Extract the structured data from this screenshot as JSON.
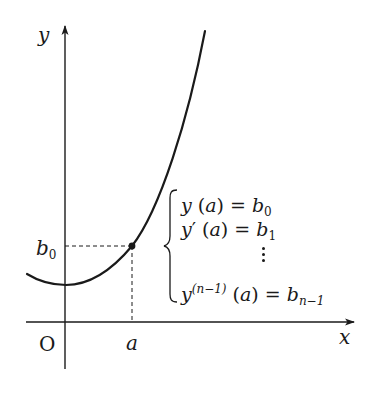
{
  "diagram": {
    "axes": {
      "x_label": "x",
      "y_label": "y",
      "origin_label": "O"
    },
    "curve": {
      "description": "convex curve passing through initial point (a, b0)"
    },
    "point": {
      "x_label": "a",
      "y_label_base": "b",
      "y_label_sub": "0"
    },
    "conditions": [
      {
        "lhs_func": "y",
        "lhs_mark": "",
        "lhs_arg": "(a)",
        "rhs_base": "b",
        "rhs_sub": "0"
      },
      {
        "lhs_func": "y",
        "lhs_mark": "′",
        "lhs_arg": "(a)",
        "rhs_base": "b",
        "rhs_sub": "1"
      },
      {
        "lhs_func": "y",
        "lhs_mark": "(n−1)",
        "lhs_arg": "(a)",
        "rhs_base": "b",
        "rhs_sub": "n−1"
      }
    ],
    "colors": {
      "ink": "#1a1a1a",
      "background": "#ffffff"
    }
  }
}
